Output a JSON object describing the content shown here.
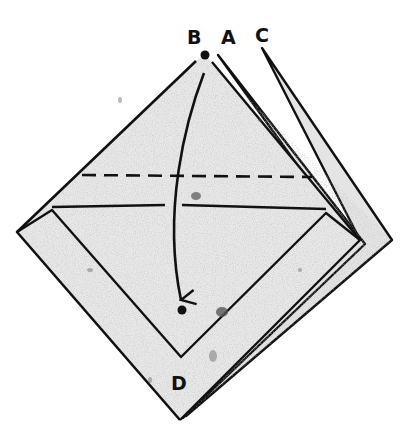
{
  "diagram": {
    "type": "origami-fold-step",
    "labels": {
      "b": "B",
      "a": "A",
      "c": "C",
      "d": "D"
    },
    "colors": {
      "paper": "#e4e4e4",
      "paper_speckle": "#9a9a9a",
      "line": "#111111",
      "background": "#ffffff"
    },
    "annotations": {
      "fold_line": "dashed valley fold line",
      "arrow": "fold point B down to point D"
    }
  }
}
